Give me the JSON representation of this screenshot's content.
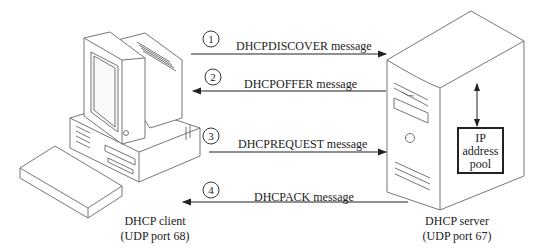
{
  "diagram": {
    "client": {
      "line1": "DHCP client",
      "line2": "(UDP port 68)"
    },
    "server": {
      "line1": "DHCP server",
      "line2": "(UDP port 67)"
    },
    "pool": {
      "line1": "IP",
      "line2": "address",
      "line3": "pool"
    },
    "messages": [
      {
        "step": "1",
        "label": "DHCPDISCOVER message",
        "direction": "client-to-server"
      },
      {
        "step": "2",
        "label": "DHCPOFFER message",
        "direction": "server-to-client"
      },
      {
        "step": "3",
        "label": "DHCPREQUEST message",
        "direction": "client-to-server"
      },
      {
        "step": "4",
        "label": "DHCPACK message",
        "direction": "server-to-client"
      }
    ],
    "colors": {
      "line": "#222222",
      "stroke_light": "#666666",
      "background": "#ffffff"
    }
  }
}
